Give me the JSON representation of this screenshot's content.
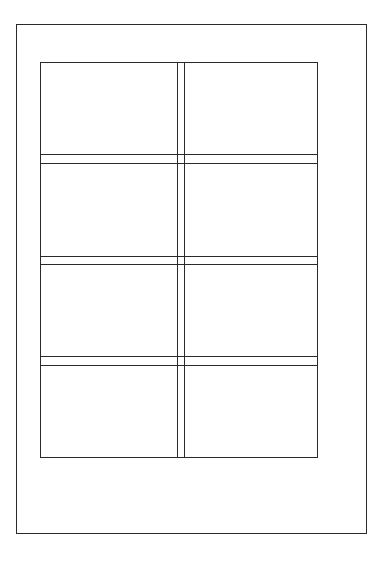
{
  "diagram": {
    "type": "label-sheet-layout",
    "page": {
      "left": 16,
      "top": 24,
      "right": 367,
      "bottom": 534
    },
    "grid": {
      "left": 40,
      "top": 62,
      "right": 318,
      "bottom": 458,
      "columns": 2,
      "rows": 4
    },
    "vertical_gutter": [
      177,
      184
    ],
    "horizontal_gutters": [
      [
        154,
        163
      ],
      [
        256,
        264
      ],
      [
        356,
        365
      ]
    ],
    "line_color": "#2a2a2a",
    "background": "#ffffff"
  }
}
